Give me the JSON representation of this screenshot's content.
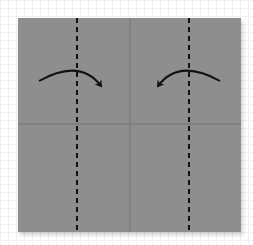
{
  "diagram": {
    "paper": {
      "color": "#8e8e8e",
      "x": 18,
      "y": 18,
      "width": 223,
      "height": 214
    },
    "crease_lines": [
      {
        "type": "crease",
        "orientation": "vertical",
        "x": 130
      },
      {
        "type": "crease",
        "orientation": "horizontal",
        "y": 124
      }
    ],
    "fold_lines": [
      {
        "type": "valley-fold",
        "style": "dashed",
        "x": 77
      },
      {
        "type": "valley-fold",
        "style": "dashed",
        "x": 189
      }
    ],
    "arrows": [
      {
        "direction": "right",
        "from": [
          39,
          81
        ],
        "to": [
          103,
          88
        ],
        "meaning": "fold left flap toward center"
      },
      {
        "direction": "left",
        "from": [
          220,
          81
        ],
        "to": [
          156,
          88
        ],
        "meaning": "fold right flap toward center"
      }
    ],
    "colors": {
      "line": "#111111",
      "crease": "#6f6f6f",
      "background": "#ffffff"
    }
  }
}
